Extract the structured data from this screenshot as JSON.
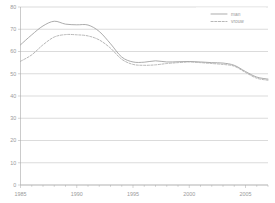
{
  "chart_data": {
    "type": "line",
    "title": "",
    "subtitle": "",
    "xlabel": "",
    "ylabel": "",
    "xlim": [
      1985,
      2007
    ],
    "ylim": [
      0,
      80
    ],
    "ytick_values": [
      0,
      10,
      20,
      30,
      40,
      50,
      60,
      70,
      80
    ],
    "ytick_labels": [
      "0",
      "10",
      "20",
      "30",
      "40",
      "50",
      "60",
      "70",
      "80"
    ],
    "xtick_values": [
      1985,
      1990,
      1995,
      2000,
      2005
    ],
    "xtick_labels": [
      "1985",
      "1990",
      "1995",
      "2000",
      "2005"
    ],
    "x_minor_ticks": [
      1985,
      1986,
      1987,
      1988,
      1989,
      1990,
      1991,
      1992,
      1993,
      1994,
      1995,
      1996,
      1997,
      1998,
      1999,
      2000,
      2001,
      2002,
      2003,
      2004,
      2005,
      2006,
      2007
    ],
    "grid": "horizontal",
    "legend_position": "top-right",
    "x": [
      1985,
      1986,
      1987,
      1988,
      1989,
      1990,
      1991,
      1992,
      1993,
      1994,
      1995,
      1996,
      1997,
      1998,
      1999,
      2000,
      2001,
      2002,
      2003,
      2004,
      2005,
      2006,
      2007
    ],
    "series": [
      {
        "name": "man",
        "style": "solid",
        "color": "#9d9d9d",
        "values": [
          63.0,
          67.5,
          71.5,
          73.6,
          72.3,
          72.0,
          71.9,
          69.0,
          63.5,
          57.5,
          55.3,
          55.2,
          55.8,
          55.3,
          55.4,
          55.5,
          55.3,
          55.0,
          54.8,
          53.8,
          51.0,
          48.5,
          47.6
        ]
      },
      {
        "name": "vrouw",
        "style": "dashed",
        "color": "#a5a5a5",
        "values": [
          55.6,
          58.5,
          63.0,
          66.5,
          67.6,
          67.5,
          67.0,
          65.2,
          61.5,
          56.5,
          54.2,
          53.8,
          54.0,
          54.6,
          55.0,
          55.3,
          55.0,
          54.6,
          54.2,
          53.4,
          50.6,
          48.0,
          47.1
        ]
      }
    ]
  },
  "legend": {
    "entries": [
      {
        "label": "man",
        "style": "solid"
      },
      {
        "label": "vrouw",
        "style": "dashed"
      }
    ]
  },
  "colors": {
    "background": "#ffffff",
    "gridline": "#b7b7b7",
    "axis": "#a8a8a8",
    "text": "#9a9a9a",
    "series_solid": "#9d9d9d",
    "series_dashed": "#a5a5a5"
  }
}
